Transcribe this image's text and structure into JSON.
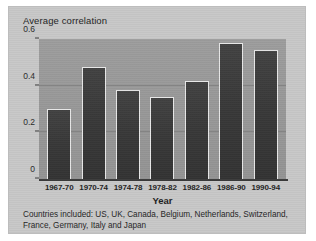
{
  "figure": {
    "ylabel": "Average correlation",
    "xlabel": "Year",
    "caption_line1": "Countries included: US, UK, Canada, Belgium, Netherlands, Switzerland,",
    "caption_line2": "France, Germany, Italy and Japan",
    "colors": {
      "page_background": "#c8c8c8",
      "plot_background": "#9a9a9a",
      "bar_fill": "#3c3c3c",
      "bar_outline": "#e8e8e8",
      "gridline": "#7d7d7d",
      "axis": "#3a3a3a",
      "text": "#232323"
    }
  },
  "chart_data": {
    "type": "bar",
    "title": "",
    "subtitle": "",
    "xlabel": "Year",
    "ylabel": "Average correlation",
    "categories": [
      "1967-70",
      "1970-74",
      "1974-78",
      "1978-82",
      "1982-86",
      "1986-90",
      "1990-94"
    ],
    "values": [
      0.3,
      0.48,
      0.38,
      0.35,
      0.42,
      0.585,
      0.555
    ],
    "ylim": [
      0,
      0.6
    ],
    "yticks": [
      0,
      0.2,
      0.4,
      0.6
    ],
    "ytick_labels": [
      "0",
      "0.2",
      "0.4",
      "0.6"
    ],
    "grid": true,
    "grid_axis": "y",
    "legend": false,
    "legend_position": "none",
    "annotations": [
      "Countries included: US, UK, Canada, Belgium, Netherlands, Switzerland, France, Germany, Italy and Japan"
    ]
  }
}
